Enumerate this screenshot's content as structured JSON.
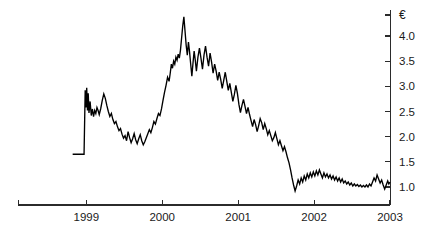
{
  "chart_data": {
    "type": "line",
    "title": "",
    "subtitle": "",
    "xlabel": "",
    "ylabel": "",
    "unit_symbol": "€",
    "grid": false,
    "legend": null,
    "y_axis_position": "right",
    "xlim": [
      1998.1,
      2003.0
    ],
    "ylim": [
      0.62,
      4.62
    ],
    "x_ticks": [
      1999,
      2000,
      2001,
      2002,
      2003
    ],
    "x_tick_labels": [
      "1999",
      "2000",
      "2001",
      "2002",
      "2003"
    ],
    "y_ticks": [
      1.0,
      1.5,
      2.0,
      2.5,
      3.0,
      3.5,
      4.0
    ],
    "y_tick_labels": [
      "1.0",
      "1.5",
      "2.0",
      "2.5",
      "3.0",
      "3.5",
      "4.0"
    ],
    "series": [
      {
        "name": "share price",
        "color": "#000000",
        "x": [
          1998.82,
          1998.86,
          1998.9,
          1998.94,
          1998.97,
          1998.985,
          1998.995,
          1999.005,
          1999.015,
          1999.025,
          1999.035,
          1999.05,
          1999.065,
          1999.08,
          1999.095,
          1999.11,
          1999.125,
          1999.14,
          1999.155,
          1999.17,
          1999.19,
          1999.21,
          1999.23,
          1999.25,
          1999.27,
          1999.29,
          1999.31,
          1999.33,
          1999.35,
          1999.37,
          1999.39,
          1999.41,
          1999.43,
          1999.45,
          1999.47,
          1999.49,
          1999.51,
          1999.53,
          1999.55,
          1999.57,
          1999.59,
          1999.61,
          1999.63,
          1999.65,
          1999.67,
          1999.69,
          1999.71,
          1999.73,
          1999.75,
          1999.77,
          1999.79,
          1999.81,
          1999.83,
          1999.85,
          1999.87,
          1999.89,
          1999.91,
          1999.93,
          1999.95,
          1999.97,
          1999.99,
          2000.01,
          2000.03,
          2000.05,
          2000.07,
          2000.09,
          2000.105,
          2000.12,
          2000.135,
          2000.15,
          2000.165,
          2000.18,
          2000.195,
          2000.21,
          2000.225,
          2000.24,
          2000.255,
          2000.27,
          2000.285,
          2000.3,
          2000.315,
          2000.33,
          2000.345,
          2000.36,
          2000.375,
          2000.39,
          2000.405,
          2000.42,
          2000.435,
          2000.45,
          2000.47,
          2000.49,
          2000.51,
          2000.53,
          2000.55,
          2000.57,
          2000.59,
          2000.61,
          2000.63,
          2000.65,
          2000.67,
          2000.69,
          2000.71,
          2000.73,
          2000.75,
          2000.77,
          2000.79,
          2000.81,
          2000.83,
          2000.85,
          2000.87,
          2000.89,
          2000.91,
          2000.93,
          2000.95,
          2000.97,
          2000.99,
          2001.01,
          2001.03,
          2001.05,
          2001.07,
          2001.09,
          2001.11,
          2001.13,
          2001.15,
          2001.17,
          2001.19,
          2001.21,
          2001.23,
          2001.25,
          2001.27,
          2001.29,
          2001.31,
          2001.33,
          2001.35,
          2001.37,
          2001.39,
          2001.41,
          2001.43,
          2001.45,
          2001.47,
          2001.49,
          2001.51,
          2001.53,
          2001.55,
          2001.57,
          2001.59,
          2001.61,
          2001.63,
          2001.65,
          2001.67,
          2001.69,
          2001.71,
          2001.73,
          2001.75,
          2001.77,
          2001.79,
          2001.81,
          2001.83,
          2001.85,
          2001.87,
          2001.89,
          2001.91,
          2001.93,
          2001.95,
          2001.97,
          2001.99,
          2002.01,
          2002.03,
          2002.05,
          2002.07,
          2002.09,
          2002.11,
          2002.13,
          2002.15,
          2002.17,
          2002.19,
          2002.21,
          2002.23,
          2002.25,
          2002.27,
          2002.29,
          2002.31,
          2002.33,
          2002.35,
          2002.37,
          2002.39,
          2002.41,
          2002.43,
          2002.45,
          2002.47,
          2002.49,
          2002.51,
          2002.53,
          2002.55,
          2002.57,
          2002.59,
          2002.61,
          2002.63,
          2002.65,
          2002.67,
          2002.69,
          2002.71,
          2002.73,
          2002.75,
          2002.77,
          2002.79,
          2002.81,
          2002.83,
          2002.85,
          2002.87,
          2002.89,
          2002.91,
          2002.93,
          2002.95,
          2002.97,
          2002.985,
          2003.0
        ],
        "y": [
          1.65,
          1.65,
          1.65,
          1.65,
          1.65,
          2.92,
          2.58,
          2.97,
          2.52,
          2.86,
          2.47,
          2.7,
          2.42,
          2.55,
          2.4,
          2.52,
          2.46,
          2.58,
          2.52,
          2.44,
          2.56,
          2.72,
          2.85,
          2.76,
          2.62,
          2.5,
          2.4,
          2.46,
          2.34,
          2.26,
          2.3,
          2.2,
          2.12,
          2.16,
          2.05,
          1.97,
          2.02,
          1.92,
          2.1,
          1.98,
          1.88,
          1.96,
          2.06,
          1.94,
          1.86,
          1.96,
          2.04,
          1.92,
          1.84,
          1.9,
          1.98,
          2.06,
          2.14,
          2.08,
          2.18,
          2.3,
          2.25,
          2.36,
          2.46,
          2.42,
          2.55,
          2.72,
          2.88,
          3.02,
          3.18,
          3.1,
          3.26,
          3.44,
          3.36,
          3.5,
          3.44,
          3.58,
          3.52,
          3.64,
          3.56,
          3.72,
          3.96,
          4.2,
          4.38,
          4.1,
          3.82,
          3.62,
          3.88,
          3.68,
          3.44,
          3.2,
          3.46,
          3.7,
          3.52,
          3.3,
          3.58,
          3.76,
          3.56,
          3.34,
          3.62,
          3.8,
          3.58,
          3.4,
          3.66,
          3.48,
          3.26,
          3.44,
          3.3,
          3.12,
          3.28,
          3.14,
          2.96,
          3.12,
          3.28,
          3.1,
          2.92,
          3.06,
          2.88,
          2.7,
          2.84,
          3.02,
          2.86,
          2.64,
          2.48,
          2.62,
          2.74,
          2.6,
          2.46,
          2.58,
          2.44,
          2.32,
          2.2,
          2.34,
          2.24,
          2.1,
          2.22,
          2.36,
          2.28,
          2.14,
          2.26,
          2.16,
          2.04,
          2.12,
          2.02,
          1.92,
          1.98,
          2.08,
          1.96,
          1.84,
          1.92,
          1.82,
          1.72,
          1.8,
          1.7,
          1.58,
          1.48,
          1.34,
          1.18,
          1.04,
          0.92,
          1.02,
          1.14,
          1.06,
          1.18,
          1.1,
          1.22,
          1.14,
          1.26,
          1.18,
          1.28,
          1.2,
          1.3,
          1.22,
          1.32,
          1.24,
          1.34,
          1.26,
          1.18,
          1.28,
          1.2,
          1.26,
          1.18,
          1.24,
          1.16,
          1.22,
          1.14,
          1.2,
          1.12,
          1.18,
          1.1,
          1.16,
          1.08,
          1.12,
          1.06,
          1.1,
          1.04,
          1.08,
          1.02,
          1.06,
          1.02,
          1.05,
          1.01,
          1.04,
          1.0,
          1.03,
          1.0,
          1.04,
          1.0,
          1.06,
          1.02,
          1.1,
          1.18,
          1.12,
          1.24,
          1.16,
          1.08,
          1.14,
          1.04,
          0.96,
          1.04,
          1.12,
          1.06,
          1.1
        ]
      }
    ]
  }
}
